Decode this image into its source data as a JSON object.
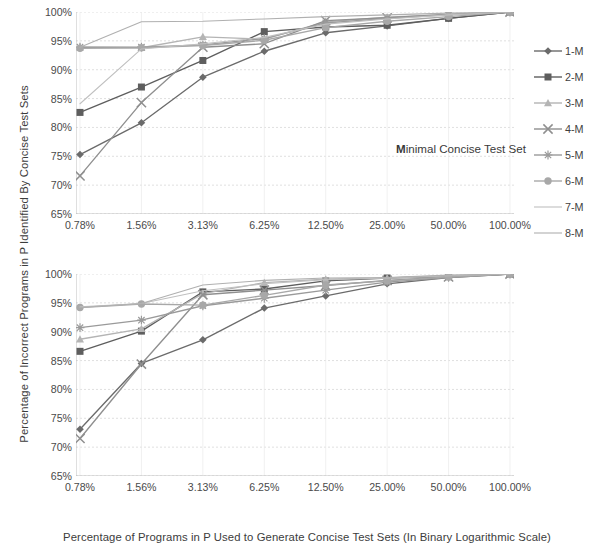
{
  "axes": {
    "y_title": "Percentage of Incorrect Programs in P Identified By Concise Test Sets",
    "x_title": "Percentage of Programs in P Used to Generate Concise Test Sets (In Binary Logarithmic Scale)"
  },
  "annotations": {
    "minimal_prefix": "M",
    "minimal_rest": "inimal Concise Test Set",
    "gradated_prefix": "G",
    "gradated_rest": "radated Concise Test Set"
  },
  "chart_data": [
    {
      "type": "line",
      "title": "Minimal Concise Test Set",
      "xlabel": "Percentage of Programs in P Used to Generate Concise Test Sets (In Binary Logarithmic Scale)",
      "ylabel": "Percentage of Incorrect Programs in P Identified By Concise Test Sets",
      "categories": [
        "0.78%",
        "1.56%",
        "3.13%",
        "6.25%",
        "12.50%",
        "25.00%",
        "50.00%",
        "100.00%"
      ],
      "ylim": [
        65,
        100
      ],
      "yticks": [
        "65%",
        "70%",
        "75%",
        "80%",
        "85%",
        "90%",
        "95%",
        "100%"
      ],
      "ytick_values": [
        65,
        70,
        75,
        80,
        85,
        90,
        95,
        100
      ],
      "grid": true,
      "legend_position": "right",
      "series": [
        {
          "name": "1-M",
          "marker": "diamond",
          "color": "#6b6b6b",
          "values": [
            75.3,
            80.8,
            88.7,
            93.2,
            96.4,
            97.6,
            98.9,
            100.0
          ]
        },
        {
          "name": "2-M",
          "marker": "square",
          "color": "#5e5e5e",
          "values": [
            82.6,
            87.0,
            91.6,
            96.6,
            97.4,
            97.7,
            98.9,
            100.0
          ]
        },
        {
          "name": "3-M",
          "marker": "triangle",
          "color": "#b4b4b4",
          "values": [
            93.9,
            93.8,
            95.7,
            95.3,
            98.3,
            99.1,
            99.6,
            100.0
          ]
        },
        {
          "name": "4-M",
          "marker": "cross",
          "color": "#8f8f8f",
          "values": [
            71.6,
            84.3,
            93.9,
            94.5,
            98.5,
            99.0,
            99.6,
            100.0
          ]
        },
        {
          "name": "5-M",
          "marker": "star",
          "color": "#9a9a9a",
          "values": [
            93.9,
            93.9,
            94.3,
            95.4,
            98.1,
            98.9,
            99.5,
            100.0
          ]
        },
        {
          "name": "6-M",
          "marker": "circle",
          "color": "#a8a8a8",
          "values": [
            93.7,
            93.8,
            94.2,
            95.1,
            97.3,
            98.4,
            99.2,
            100.0
          ]
        },
        {
          "name": "7-M",
          "marker": "line",
          "color": "#c0c0c0",
          "values": [
            84.1,
            93.6,
            94.5,
            95.6,
            97.9,
            98.8,
            99.5,
            100.0
          ]
        },
        {
          "name": "8-M",
          "marker": "line",
          "color": "#b0b0b0",
          "values": [
            93.9,
            98.3,
            98.4,
            98.8,
            99.2,
            99.5,
            99.8,
            100.0
          ]
        }
      ]
    },
    {
      "type": "line",
      "title": "Gradated Concise Test Set",
      "xlabel": "Percentage of Programs in P Used to Generate Concise Test Sets (In Binary Logarithmic Scale)",
      "ylabel": "Percentage of Incorrect Programs in P Identified By Concise Test Sets",
      "categories": [
        "0.78%",
        "1.56%",
        "3.13%",
        "6.25%",
        "12.50%",
        "25.00%",
        "50.00%",
        "100.00%"
      ],
      "ylim": [
        65,
        100
      ],
      "yticks": [
        "65%",
        "70%",
        "75%",
        "80%",
        "85%",
        "90%",
        "95%",
        "100%"
      ],
      "ytick_values": [
        65,
        70,
        75,
        80,
        85,
        90,
        95,
        100
      ],
      "grid": true,
      "legend_position": "right",
      "series": [
        {
          "name": "1-G",
          "marker": "diamond",
          "color": "#6b6b6b",
          "values": [
            73.1,
            84.5,
            88.6,
            94.1,
            96.2,
            98.3,
            99.4,
            100.0
          ]
        },
        {
          "name": "2-G",
          "marker": "square",
          "color": "#5e5e5e",
          "values": [
            86.6,
            90.1,
            96.9,
            97.4,
            98.8,
            99.3,
            99.6,
            100.0
          ]
        },
        {
          "name": "3-G",
          "marker": "triangle",
          "color": "#b4b4b4",
          "values": [
            88.7,
            90.5,
            96.6,
            98.5,
            99.1,
            99.3,
            99.7,
            100.0
          ]
        },
        {
          "name": "4-G",
          "marker": "cross",
          "color": "#8f8f8f",
          "values": [
            71.5,
            84.4,
            96.4,
            97.2,
            98.0,
            98.9,
            99.5,
            100.0
          ]
        },
        {
          "name": "5-G",
          "marker": "star",
          "color": "#9a9a9a",
          "values": [
            90.7,
            92.0,
            94.5,
            95.8,
            97.2,
            98.6,
            99.4,
            100.0
          ]
        },
        {
          "name": "6-G",
          "marker": "circle",
          "color": "#a8a8a8",
          "values": [
            94.2,
            94.8,
            94.6,
            96.3,
            98.1,
            98.8,
            99.5,
            100.0
          ]
        },
        {
          "name": "7-G",
          "marker": "line",
          "color": "#c0c0c0",
          "values": [
            94.3,
            94.9,
            97.1,
            98.3,
            99.0,
            99.3,
            99.7,
            100.0
          ]
        },
        {
          "name": "8-G",
          "marker": "line",
          "color": "#b0b0b0",
          "values": [
            94.2,
            94.9,
            98.1,
            98.9,
            99.3,
            99.4,
            99.8,
            100.0
          ]
        }
      ]
    }
  ]
}
